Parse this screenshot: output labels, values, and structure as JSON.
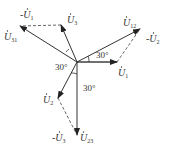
{
  "center": {
    "x": 77,
    "y": 62
  },
  "colors": {
    "line": "#333333",
    "dashed": "#555555",
    "background": "#ffffff"
  },
  "phasors": [
    {
      "id": "U1",
      "label": "U",
      "sub": "1",
      "tip": {
        "x": 117,
        "y": 62
      },
      "label_pos": {
        "x": 118,
        "y": 76
      },
      "style": "solid"
    },
    {
      "id": "U2",
      "label": "U",
      "sub": "2",
      "tip": {
        "x": 58,
        "y": 98
      },
      "label_pos": {
        "x": 43,
        "y": 103
      },
      "style": "solid"
    },
    {
      "id": "U3",
      "label": "U",
      "sub": "3",
      "tip": {
        "x": 61,
        "y": 25
      },
      "label_pos": {
        "x": 67,
        "y": 23
      },
      "style": "solid"
    },
    {
      "id": "U12",
      "label": "U",
      "sub": "12",
      "tip": {
        "x": 140,
        "y": 29
      },
      "label_pos": {
        "x": 123,
        "y": 26
      },
      "style": "solid"
    },
    {
      "id": "U23",
      "label": "U",
      "sub": "23",
      "tip": {
        "x": 77,
        "y": 135
      },
      "label_pos": {
        "x": 80,
        "y": 141
      },
      "style": "solid"
    },
    {
      "id": "U31",
      "label": "U",
      "sub": "31",
      "tip": {
        "x": 20,
        "y": 26
      },
      "label_pos": {
        "x": 4,
        "y": 40
      },
      "style": "solid"
    }
  ],
  "dashed_phasors": [
    {
      "id": "neg_U1",
      "label": "-U",
      "sub": "1",
      "from": {
        "x": 61,
        "y": 25
      },
      "to": {
        "x": 20,
        "y": 26
      },
      "label_pos": {
        "x": 20,
        "y": 18
      }
    },
    {
      "id": "neg_U2",
      "label": "-U",
      "sub": "2",
      "from": {
        "x": 117,
        "y": 62
      },
      "to": {
        "x": 140,
        "y": 29
      },
      "label_pos": {
        "x": 146,
        "y": 42
      }
    },
    {
      "id": "neg_U3",
      "label": "-U",
      "sub": "3",
      "from": {
        "x": 58,
        "y": 98
      },
      "to": {
        "x": 77,
        "y": 135
      },
      "label_pos": {
        "x": 52,
        "y": 141
      }
    }
  ],
  "angles": [
    {
      "label": "30°",
      "pos": {
        "x": 55,
        "y": 70
      }
    },
    {
      "label": "30°",
      "pos": {
        "x": 96,
        "y": 58
      }
    },
    {
      "label": "30°",
      "pos": {
        "x": 83,
        "y": 91
      }
    }
  ],
  "reference_lines": [
    {
      "from": {
        "x": 77,
        "y": 62
      },
      "to": {
        "x": 117,
        "y": 62
      }
    }
  ]
}
